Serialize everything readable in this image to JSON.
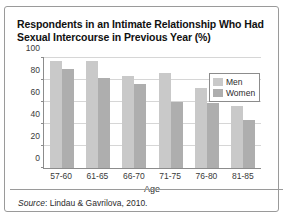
{
  "chart_data": {
    "type": "bar",
    "title": "Respondents in an Intimate Relationship Who Had Sexual Intercourse in Previous Year (%)",
    "xlabel": "Age",
    "ylabel": "",
    "ylim": [
      0,
      100
    ],
    "yticks": [
      0,
      20,
      40,
      60,
      80,
      100
    ],
    "grid": true,
    "legend_position": "top-right",
    "categories": [
      "57-60",
      "61-65",
      "66-70",
      "71-75",
      "76-80",
      "81-85"
    ],
    "series": [
      {
        "name": "Men",
        "color": "#c9c9c9",
        "values": [
          97,
          97,
          84,
          86,
          73,
          56
        ]
      },
      {
        "name": "Women",
        "color": "#aeaeae",
        "values": [
          90,
          82,
          76,
          60,
          59,
          44
        ]
      }
    ]
  },
  "source": {
    "label": "Source",
    "separator": ": ",
    "text": "Lindau & Gavrilova, 2010."
  }
}
